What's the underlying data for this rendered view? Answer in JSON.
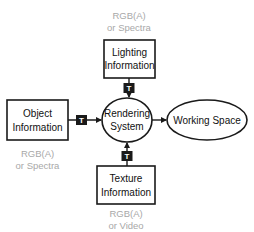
{
  "nodes": {
    "lighting": {
      "line1": "Lighting",
      "line2": "Information",
      "note1": "RGB(A)",
      "note2": "or Spectra"
    },
    "object": {
      "line1": "Object",
      "line2": "Information",
      "note1": "RGB(A)",
      "note2": "or Spectra"
    },
    "texture": {
      "line1": "Texture",
      "line2": "Information",
      "note1": "RGB(A)",
      "note2": "or Video"
    },
    "rendering": {
      "line1": "Rendering",
      "line2": "System"
    },
    "working": {
      "label": "Working Space"
    }
  },
  "badge": {
    "label": "T"
  },
  "colors": {
    "stroke": "#1a1a1a",
    "note": "#a8a8a8",
    "badge": "#1a1a1a"
  }
}
